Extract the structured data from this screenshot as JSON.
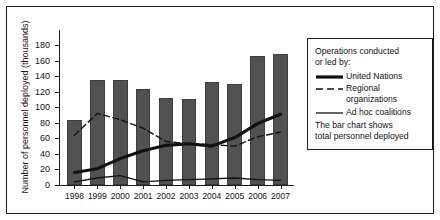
{
  "chart_data": {
    "type": "bar",
    "title": "",
    "subtitle": "",
    "xlabel": "",
    "ylabel": "Number of personnel deployed (thousands)",
    "categories": [
      "1998",
      "1999",
      "2000",
      "2001",
      "2002",
      "2003",
      "2004",
      "2005",
      "2006",
      "2007"
    ],
    "values": [
      84,
      135,
      135,
      124,
      112,
      111,
      133,
      130,
      166,
      168
    ],
    "bar_series_name": "Total personnel deployed",
    "ylim": [
      0,
      180
    ],
    "yticks": [
      0,
      20,
      40,
      60,
      80,
      100,
      120,
      140,
      160,
      180
    ],
    "grid": false,
    "legend_position": "right",
    "series": [
      {
        "name": "United Nations",
        "style": "solid-thick",
        "values": [
          16,
          21,
          34,
          44,
          51,
          53,
          50,
          61,
          79,
          91
        ]
      },
      {
        "name": "Regional organizations",
        "style": "dashed",
        "values": [
          64,
          92,
          84,
          73,
          56,
          53,
          52,
          50,
          62,
          68
        ]
      },
      {
        "name": "Ad hoc coalitions",
        "style": "solid-thin",
        "values": [
          4,
          9,
          12,
          4,
          6,
          7,
          8,
          9,
          7,
          6
        ]
      }
    ],
    "annotations": []
  },
  "legend": {
    "heading_line1": "Operations conducted",
    "heading_line2": "or led by:",
    "items": [
      {
        "label": "United Nations",
        "style": "solid-thick"
      },
      {
        "label": "Regional",
        "label2": "organizations",
        "style": "dashed"
      },
      {
        "label": "Ad hoc coalitions",
        "style": "solid-thin"
      }
    ],
    "note_line1": "The bar chart shows",
    "note_line2": "total personnel deployed"
  },
  "colors": {
    "bar_fill": "#525252",
    "bar_stroke": "#3d3d3d",
    "axis": "#1a1a1a",
    "line": "#111111",
    "background": "#ffffff",
    "frame": "#1a1a1a"
  }
}
